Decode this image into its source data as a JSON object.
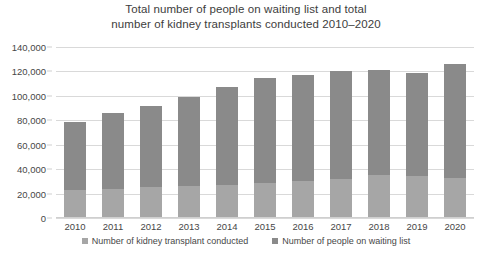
{
  "chart_data": {
    "type": "bar",
    "stacked": true,
    "title": "Total number of people on waiting list and total number of kidney transplants conducted 2010–2020",
    "title_lines": [
      "Total number of people on waiting list and total",
      "number of kidney transplants conducted 2010–2020"
    ],
    "xlabel": "",
    "ylabel": "",
    "categories": [
      "2010",
      "2011",
      "2012",
      "2013",
      "2014",
      "2015",
      "2016",
      "2017",
      "2018",
      "2019",
      "2020"
    ],
    "series": [
      {
        "name": "Number of kidney transplant conducted",
        "color": "#a6a6a6",
        "values": [
          23000,
          24000,
          25000,
          26000,
          27000,
          29000,
          30000,
          32000,
          35000,
          34000,
          33000
        ]
      },
      {
        "name": "Number of people on waiting list",
        "color": "#8a8a8a",
        "values": [
          56000,
          62000,
          67000,
          73000,
          80000,
          86000,
          87000,
          88000,
          86000,
          85000,
          93000
        ]
      }
    ],
    "totals": [
      79000,
      86000,
      92000,
      99000,
      107000,
      115000,
      117000,
      120000,
      121000,
      119000,
      126000
    ],
    "ylim": [
      0,
      140000
    ],
    "ytick_step": 20000,
    "yticks": [
      "0",
      "20,000",
      "40,000",
      "60,000",
      "80,000",
      "100,000",
      "120,000",
      "140,000"
    ],
    "ytick_values": [
      0,
      20000,
      40000,
      60000,
      80000,
      100000,
      120000,
      140000
    ],
    "grid": true,
    "legend_position": "bottom",
    "legend": [
      {
        "label": "Number of kidney transplant conducted",
        "color": "#a6a6a6"
      },
      {
        "label": "Number of people on waiting list",
        "color": "#8a8a8a"
      }
    ],
    "colors": {
      "grid": "#d9d9d9",
      "axis": "#cfcfcf",
      "text": "#474747",
      "background": "#ffffff"
    }
  }
}
